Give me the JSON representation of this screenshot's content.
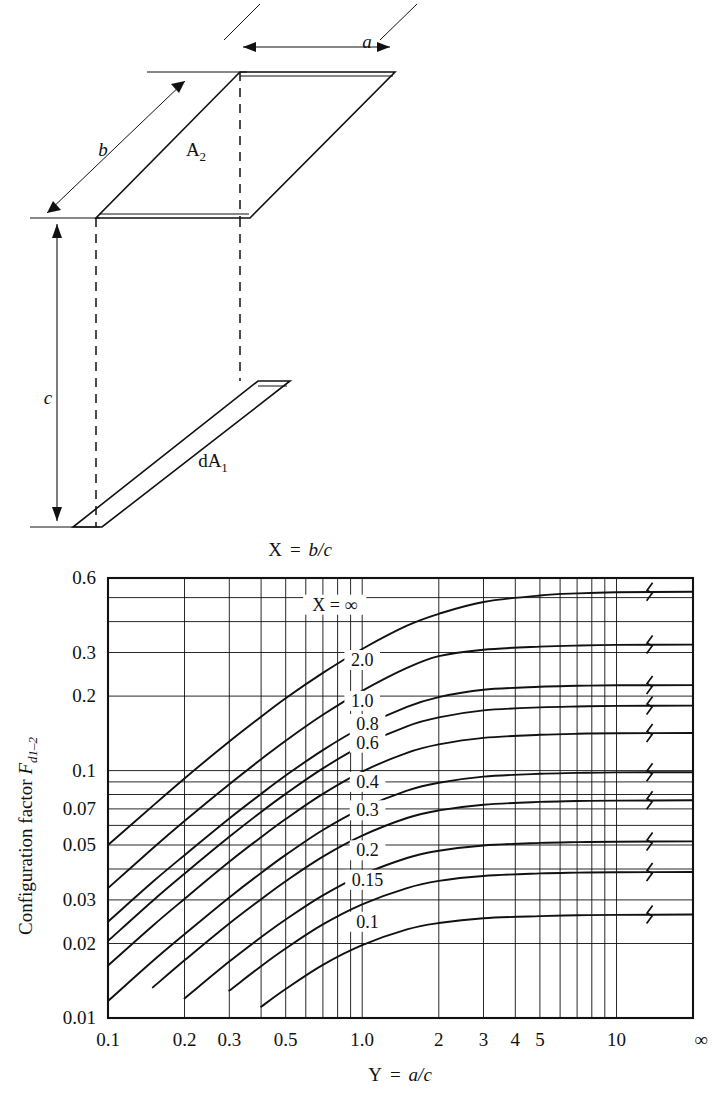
{
  "figure": {
    "diagram": {
      "label_a": "a",
      "label_b": "b",
      "label_c": "c",
      "label_A2": "A",
      "label_A2_sub": "2",
      "label_dA1": "dA",
      "label_dA1_sub": "1"
    },
    "top_label": {
      "x_var": "X",
      "equals": "=",
      "expr": "b/c"
    },
    "axis_x_title": {
      "y_var": "Y",
      "equals": "=",
      "expr": "a/c"
    },
    "axis_y_title_main": "Configuration factor ",
    "axis_y_title_sym": "F",
    "axis_y_title_sub": "d1–2"
  },
  "chart_data": {
    "type": "line",
    "title": "",
    "xlabel": "Y = a/c",
    "ylabel": "Configuration factor F_d1-2",
    "xscale": "log",
    "yscale": "log",
    "xlim": [
      0.1,
      20
    ],
    "ylim": [
      0.01,
      0.6
    ],
    "xticks": [
      0.1,
      0.2,
      0.3,
      0.5,
      1.0,
      2,
      3,
      4,
      5,
      10
    ],
    "xticklabels": [
      "0.1",
      "0.2",
      "0.3",
      "0.5",
      "1.0",
      "2",
      "3",
      "4",
      "5",
      "10",
      "∞"
    ],
    "yticks": [
      0.01,
      0.02,
      0.03,
      0.05,
      0.07,
      0.1,
      0.2,
      0.3,
      0.6
    ],
    "yticklabels": [
      "0.01",
      "0.02",
      "0.03",
      "0.05",
      "0.07",
      "0.1",
      "0.2",
      "0.3",
      "0.6"
    ],
    "grid": true,
    "legend_position": "inline-curve-labels",
    "legend_prefix": "X =",
    "break_marks": true,
    "series": [
      {
        "name": "∞",
        "label": "X  =  ∞",
        "x": [
          0.1,
          0.15,
          0.2,
          0.3,
          0.4,
          0.5,
          0.7,
          1.0,
          1.5,
          2.0,
          3.0,
          5.0,
          7.0,
          10.0,
          20.0
        ],
        "y": [
          0.05,
          0.072,
          0.093,
          0.131,
          0.165,
          0.196,
          0.248,
          0.31,
          0.385,
          0.43,
          0.48,
          0.51,
          0.52,
          0.525,
          0.528
        ]
      },
      {
        "name": "2.0",
        "label": "2.0",
        "x": [
          0.1,
          0.15,
          0.2,
          0.3,
          0.4,
          0.5,
          0.7,
          1.0,
          1.5,
          2.0,
          3.0,
          5.0,
          7.0,
          10.0,
          20.0
        ],
        "y": [
          0.0335,
          0.0485,
          0.0625,
          0.088,
          0.111,
          0.132,
          0.168,
          0.21,
          0.26,
          0.29,
          0.308,
          0.317,
          0.32,
          0.322,
          0.323
        ]
      },
      {
        "name": "1.0",
        "label": "1.0",
        "x": [
          0.1,
          0.15,
          0.2,
          0.3,
          0.4,
          0.5,
          0.7,
          1.0,
          1.5,
          2.0,
          3.0,
          5.0,
          7.0,
          10.0,
          20.0
        ],
        "y": [
          0.0245,
          0.0355,
          0.0455,
          0.064,
          0.0805,
          0.0955,
          0.121,
          0.15,
          0.181,
          0.198,
          0.212,
          0.218,
          0.22,
          0.221,
          0.2215
        ]
      },
      {
        "name": "0.8",
        "label": "0.8",
        "x": [
          0.1,
          0.15,
          0.2,
          0.3,
          0.4,
          0.5,
          0.7,
          1.0,
          1.5,
          2.0,
          3.0,
          5.0,
          7.0,
          10.0,
          20.0
        ],
        "y": [
          0.0205,
          0.0298,
          0.0383,
          0.054,
          0.068,
          0.0805,
          0.102,
          0.126,
          0.151,
          0.164,
          0.175,
          0.18,
          0.1815,
          0.1825,
          0.183
        ]
      },
      {
        "name": "0.6",
        "label": "0.6",
        "x": [
          0.1,
          0.15,
          0.2,
          0.3,
          0.4,
          0.5,
          0.7,
          1.0,
          1.5,
          2.0,
          3.0,
          5.0,
          7.0,
          10.0,
          20.0
        ],
        "y": [
          0.0163,
          0.0236,
          0.0303,
          0.0428,
          0.0538,
          0.0637,
          0.0805,
          0.099,
          0.118,
          0.1275,
          0.1355,
          0.1395,
          0.1408,
          0.1415,
          0.1418
        ]
      },
      {
        "name": "0.4",
        "label": "0.4",
        "x": [
          0.1,
          0.15,
          0.2,
          0.3,
          0.4,
          0.5,
          0.7,
          1.0,
          1.5,
          2.0,
          3.0,
          5.0,
          7.0,
          10.0,
          20.0
        ],
        "y": [
          0.0117,
          0.017,
          0.0218,
          0.0307,
          0.0386,
          0.0456,
          0.0575,
          0.0702,
          0.083,
          0.0893,
          0.0945,
          0.097,
          0.0978,
          0.0983,
          0.0985
        ]
      },
      {
        "name": "0.3",
        "label": "0.3",
        "x": [
          0.1,
          0.15,
          0.2,
          0.3,
          0.4,
          0.5,
          0.7,
          1.0,
          1.5,
          2.0,
          3.0,
          5.0,
          7.0,
          10.0,
          20.0
        ],
        "y": [
          0.0092,
          0.0133,
          0.0171,
          0.0241,
          0.0302,
          0.0357,
          0.0449,
          0.0546,
          0.0643,
          0.069,
          0.0728,
          0.0747,
          0.0753,
          0.0756,
          0.0758
        ]
      },
      {
        "name": "0.2",
        "label": "0.2",
        "x": [
          0.1,
          0.15,
          0.2,
          0.3,
          0.4,
          0.5,
          0.7,
          1.0,
          1.5,
          2.0,
          3.0,
          5.0,
          7.0,
          10.0,
          20.0
        ],
        "y": [
          0.0064,
          0.0093,
          0.012,
          0.0169,
          0.0212,
          0.025,
          0.0313,
          0.0379,
          0.0443,
          0.0474,
          0.0498,
          0.051,
          0.0514,
          0.0516,
          0.0517
        ]
      },
      {
        "name": "0.15",
        "label": "0.15",
        "x": [
          0.1,
          0.15,
          0.2,
          0.3,
          0.4,
          0.5,
          0.7,
          1.0,
          1.5,
          2.0,
          3.0,
          5.0,
          7.0,
          10.0,
          20.0
        ],
        "y": [
          0.0049,
          0.0071,
          0.0092,
          0.0129,
          0.0162,
          0.0191,
          0.0239,
          0.0288,
          0.0335,
          0.0358,
          0.0375,
          0.0384,
          0.0387,
          0.0388,
          0.0389
        ]
      },
      {
        "name": "0.1",
        "label": "0.1",
        "x": [
          0.1,
          0.15,
          0.2,
          0.3,
          0.4,
          0.5,
          0.7,
          1.0,
          1.5,
          2.0,
          3.0,
          5.0,
          7.0,
          10.0,
          20.0
        ],
        "y": [
          0.0034,
          0.0049,
          0.0063,
          0.0089,
          0.0111,
          0.0131,
          0.0164,
          0.0197,
          0.0228,
          0.0242,
          0.0253,
          0.0258,
          0.026,
          0.0261,
          0.0262
        ]
      }
    ]
  }
}
